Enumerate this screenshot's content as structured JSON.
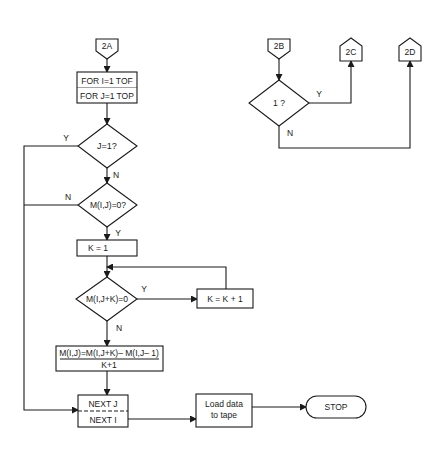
{
  "diagram": {
    "type": "flowchart",
    "colors": {
      "stroke": "#1a1a1a",
      "background": "#ffffff"
    },
    "connectors": {
      "c2A": "2A",
      "c2B": "2B",
      "c2C": "2C",
      "c2D": "2D"
    },
    "nodes": {
      "loop_start_line1": "FOR I=1 TOF",
      "loop_start_line2": "FOR J=1 TOP",
      "decision_j1": "J=1?",
      "decision_mij0": "M(I,J)=0?",
      "process_k1": "K = 1",
      "decision_mijk0": "M(I,J+K)=0",
      "process_kinc": "K = K + 1",
      "formula_numerator": "M(I,J)=M(I,J+K)– M(I,J– 1)",
      "formula_denominator": "K+1",
      "next_j": "NEXT J",
      "next_i": "NEXT I",
      "load_line1": "Load data",
      "load_line2": "to tape",
      "stop": "STOP",
      "decision_1": "1 ?"
    },
    "edge_labels": {
      "j1_yes": "Y",
      "j1_no": "N",
      "mij0_no": "N",
      "mij0_yes": "Y",
      "mijk0_yes": "Y",
      "mijk0_no": "N",
      "d1_yes": "Y",
      "d1_no": "N"
    }
  }
}
